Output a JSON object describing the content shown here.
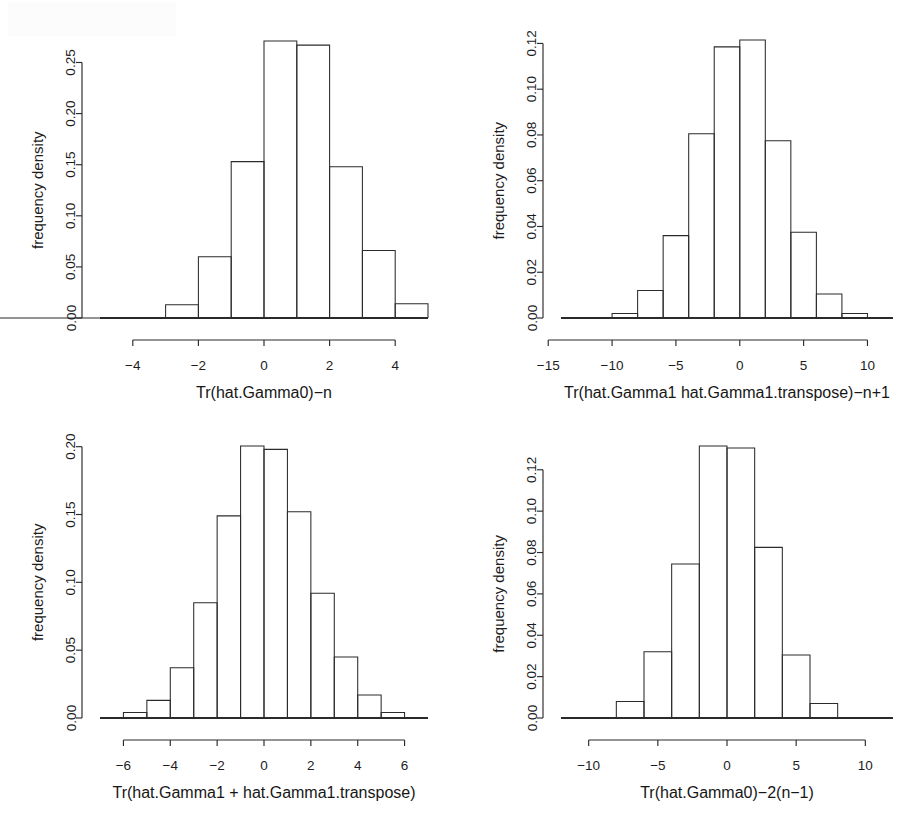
{
  "figure": {
    "kind": "histogram-grid",
    "rows": 2,
    "columns": 2,
    "background_color": "#ffffff",
    "line_color": "#2b2b2b"
  },
  "chart_data": [
    {
      "id": "panel-top-left",
      "type": "bar",
      "title": "",
      "xlabel": "Tr(hat.Gamma0)−n",
      "ylabel": "frequency density",
      "xlim": [
        -5,
        5
      ],
      "ylim": [
        0.0,
        0.272
      ],
      "xticks": [
        -4,
        -2,
        0,
        2,
        4
      ],
      "xticklabels": [
        "−4",
        "−2",
        "0",
        "2",
        "4"
      ],
      "yticks": [
        0.0,
        0.05,
        0.1,
        0.15,
        0.2,
        0.25
      ],
      "yticklabels": [
        "0.00",
        "0.05",
        "0.10",
        "0.15",
        "0.20",
        "0.25"
      ],
      "grid": false,
      "legend": "none",
      "bin_edges": [
        -5,
        -4,
        -3,
        -2,
        -1,
        0,
        1,
        2,
        3,
        4,
        5
      ],
      "values": [
        0.0,
        0.0,
        0.013,
        0.06,
        0.153,
        0.271,
        0.267,
        0.148,
        0.066,
        0.014,
        0.0
      ]
    },
    {
      "id": "panel-top-right",
      "type": "bar",
      "title": "",
      "xlabel": "Tr(hat.Gamma1 hat.Gamma1.transpose)−n+1",
      "ylabel": "frequency density",
      "xlim": [
        -14,
        12
      ],
      "ylim": [
        0.0,
        0.1215
      ],
      "xticks": [
        -15,
        -10,
        -5,
        0,
        5,
        10
      ],
      "xticklabels": [
        "−15",
        "−10",
        "−5",
        "0",
        "5",
        "10"
      ],
      "yticks": [
        0.0,
        0.02,
        0.04,
        0.06,
        0.08,
        0.1,
        0.12
      ],
      "yticklabels": [
        "0.00",
        "0.02",
        "0.04",
        "0.06",
        "0.08",
        "0.10",
        "0.12"
      ],
      "grid": false,
      "legend": "none",
      "bin_edges": [
        -14,
        -12,
        -10,
        -8,
        -6,
        -4,
        -2,
        0,
        2,
        4,
        6,
        8,
        10,
        12
      ],
      "values": [
        0.0,
        0.0,
        0.002,
        0.012,
        0.036,
        0.0805,
        0.1185,
        0.1215,
        0.0775,
        0.0375,
        0.0105,
        0.002,
        0.0
      ]
    },
    {
      "id": "panel-bottom-left",
      "type": "bar",
      "title": "",
      "xlabel": "Tr(hat.Gamma1 + hat.Gamma1.transpose)",
      "ylabel": "frequency density",
      "xlim": [
        -7,
        7
      ],
      "ylim": [
        0.0,
        0.2005
      ],
      "xticks": [
        -6,
        -4,
        -2,
        0,
        2,
        4,
        6
      ],
      "xticklabels": [
        "−6",
        "−4",
        "−2",
        "0",
        "2",
        "4",
        "6"
      ],
      "yticks": [
        0.0,
        0.05,
        0.1,
        0.15,
        0.2
      ],
      "yticklabels": [
        "0.00",
        "0.05",
        "0.10",
        "0.15",
        "0.20"
      ],
      "grid": false,
      "legend": "none",
      "bin_edges": [
        -7,
        -6,
        -5,
        -4,
        -3,
        -2,
        -1,
        0,
        1,
        2,
        3,
        4,
        5,
        6,
        7
      ],
      "values": [
        0.0,
        0.004,
        0.013,
        0.037,
        0.085,
        0.149,
        0.2005,
        0.198,
        0.152,
        0.092,
        0.045,
        0.017,
        0.004,
        0.0
      ]
    },
    {
      "id": "panel-bottom-right",
      "type": "bar",
      "title": "",
      "xlabel": "Tr(hat.Gamma0)−2(n−1)",
      "ylabel": "frequency density",
      "xlim": [
        -12,
        12
      ],
      "ylim": [
        0.0,
        0.1315
      ],
      "xticks": [
        -10,
        -5,
        0,
        5,
        10
      ],
      "xticklabels": [
        "−10",
        "−5",
        "0",
        "5",
        "10"
      ],
      "yticks": [
        0.0,
        0.02,
        0.04,
        0.06,
        0.08,
        0.1,
        0.12
      ],
      "yticklabels": [
        "0.00",
        "0.02",
        "0.04",
        "0.06",
        "0.08",
        "0.10",
        "0.12"
      ],
      "grid": false,
      "legend": "none",
      "bin_edges": [
        -12,
        -10,
        -8,
        -6,
        -4,
        -2,
        0,
        2,
        4,
        6,
        8,
        10,
        12
      ],
      "values": [
        0.0,
        0.0,
        0.008,
        0.032,
        0.0745,
        0.1315,
        0.1305,
        0.0825,
        0.0305,
        0.007,
        0.0,
        0.0
      ]
    }
  ]
}
